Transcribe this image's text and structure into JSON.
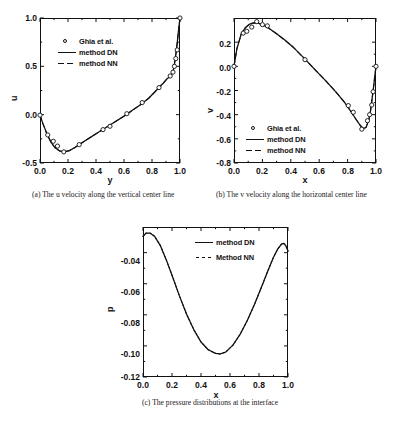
{
  "figure": {
    "background": "#ffffff",
    "ink": "#111111"
  },
  "panels": [
    {
      "id": "panel-a",
      "caption": "(a) The u velocity along the vertical center line",
      "legend": [
        {
          "marker": "circle",
          "label": "Ghia et al."
        },
        {
          "marker": "solid",
          "label": "method DN"
        },
        {
          "marker": "dash",
          "label": "method NN"
        }
      ],
      "chart_data": {
        "type": "line",
        "title": "",
        "xlabel": "y",
        "ylabel": "u",
        "xlim": [
          0.0,
          1.0
        ],
        "ylim": [
          -0.5,
          1.0
        ],
        "xticks": [
          "0.0",
          "0.2",
          "0.4",
          "0.6",
          "0.8",
          "1.0"
        ],
        "xtick_values": [
          0.0,
          0.2,
          0.4,
          0.6,
          0.8,
          1.0
        ],
        "yticks": [
          "1.0",
          "0.5",
          "0.0",
          "-0.5"
        ],
        "ytick_values": [
          1.0,
          0.5,
          0.0,
          -0.5
        ],
        "grid": false,
        "legend_position": "upper-left",
        "series": [
          {
            "name": "method DN",
            "style": "solid",
            "x": [
              0.0,
              0.02,
              0.05,
              0.08,
              0.11,
              0.14,
              0.17,
              0.21,
              0.25,
              0.3,
              0.36,
              0.42,
              0.48,
              0.54,
              0.6,
              0.66,
              0.72,
              0.78,
              0.84,
              0.88,
              0.91,
              0.93,
              0.95,
              0.96,
              0.97,
              0.98,
              0.99,
              1.0
            ],
            "y": [
              -0.005,
              -0.09,
              -0.2,
              -0.29,
              -0.345,
              -0.375,
              -0.385,
              -0.372,
              -0.34,
              -0.29,
              -0.235,
              -0.18,
              -0.125,
              -0.07,
              -0.015,
              0.045,
              0.105,
              0.175,
              0.265,
              0.325,
              0.375,
              0.395,
              0.44,
              0.52,
              0.62,
              0.74,
              0.88,
              1.0
            ]
          },
          {
            "name": "method NN",
            "style": "dashed",
            "x": [
              0.0,
              0.02,
              0.05,
              0.08,
              0.11,
              0.14,
              0.17,
              0.21,
              0.25,
              0.3,
              0.36,
              0.42,
              0.48,
              0.54,
              0.6,
              0.66,
              0.72,
              0.78,
              0.84,
              0.88,
              0.91,
              0.93,
              0.95,
              0.96,
              0.97,
              0.98,
              0.99,
              1.0
            ],
            "y": [
              -0.005,
              -0.09,
              -0.2,
              -0.29,
              -0.345,
              -0.375,
              -0.385,
              -0.372,
              -0.34,
              -0.29,
              -0.235,
              -0.18,
              -0.125,
              -0.07,
              -0.015,
              0.045,
              0.105,
              0.175,
              0.265,
              0.325,
              0.375,
              0.395,
              0.44,
              0.52,
              0.62,
              0.74,
              0.88,
              1.0
            ]
          },
          {
            "name": "Ghia et al.",
            "style": "markers",
            "x": [
              0.0,
              0.055,
              0.095,
              0.125,
              0.17,
              0.28,
              0.45,
              0.5,
              0.62,
              0.73,
              0.85,
              0.93,
              0.95,
              0.96,
              0.97,
              0.98,
              1.0
            ],
            "y": [
              -0.005,
              -0.21,
              -0.275,
              -0.325,
              -0.385,
              -0.31,
              -0.155,
              -0.12,
              0.01,
              0.125,
              0.28,
              0.4,
              0.44,
              0.5,
              0.58,
              0.67,
              1.0
            ]
          }
        ]
      }
    },
    {
      "id": "panel-b",
      "caption": "(b) The v velocity along the horizontal center line",
      "legend": [
        {
          "marker": "circle",
          "label": "Ghia et al."
        },
        {
          "marker": "solid",
          "label": "method DN"
        },
        {
          "marker": "dash",
          "label": "method NN"
        }
      ],
      "chart_data": {
        "type": "line",
        "title": "",
        "xlabel": "x",
        "ylabel": "v",
        "xlim": [
          0.0,
          1.0
        ],
        "ylim": [
          -0.8,
          0.4
        ],
        "xticks": [
          "0.0",
          "0.2",
          "0.4",
          "0.6",
          "0.8",
          "1.0"
        ],
        "xtick_values": [
          0.0,
          0.2,
          0.4,
          0.6,
          0.8,
          1.0
        ],
        "yticks": [
          "0.2",
          "0.0",
          "-0.2",
          "-0.4",
          "-0.6",
          "-0.8"
        ],
        "ytick_values": [
          0.2,
          0.0,
          -0.2,
          -0.4,
          -0.6,
          -0.8
        ],
        "grid": false,
        "legend_position": "lower-left",
        "series": [
          {
            "name": "method DN",
            "style": "solid",
            "x": [
              0.0,
              0.02,
              0.05,
              0.08,
              0.11,
              0.14,
              0.17,
              0.2,
              0.24,
              0.3,
              0.36,
              0.42,
              0.5,
              0.58,
              0.65,
              0.72,
              0.78,
              0.83,
              0.86,
              0.89,
              0.91,
              0.93,
              0.95,
              0.96,
              0.97,
              0.98,
              0.99,
              1.0
            ],
            "y": [
              0.0,
              0.145,
              0.265,
              0.32,
              0.35,
              0.36,
              0.358,
              0.345,
              0.32,
              0.27,
              0.215,
              0.155,
              0.06,
              -0.04,
              -0.125,
              -0.215,
              -0.3,
              -0.385,
              -0.44,
              -0.49,
              -0.515,
              -0.505,
              -0.44,
              -0.38,
              -0.29,
              -0.2,
              -0.1,
              0.0
            ]
          },
          {
            "name": "method NN",
            "style": "dashed",
            "x": [
              0.0,
              0.02,
              0.05,
              0.08,
              0.11,
              0.14,
              0.17,
              0.2,
              0.24,
              0.3,
              0.36,
              0.42,
              0.5,
              0.58,
              0.65,
              0.72,
              0.78,
              0.83,
              0.86,
              0.89,
              0.91,
              0.93,
              0.95,
              0.96,
              0.97,
              0.98,
              0.99,
              1.0
            ],
            "y": [
              0.0,
              0.145,
              0.265,
              0.32,
              0.35,
              0.36,
              0.358,
              0.345,
              0.32,
              0.27,
              0.215,
              0.155,
              0.06,
              -0.04,
              -0.125,
              -0.215,
              -0.3,
              -0.385,
              -0.44,
              -0.49,
              -0.515,
              -0.505,
              -0.44,
              -0.38,
              -0.29,
              -0.2,
              -0.1,
              0.0
            ]
          },
          {
            "name": "Ghia et al.",
            "style": "markers",
            "x": [
              0.0,
              0.065,
              0.09,
              0.125,
              0.16,
              0.2,
              0.235,
              0.5,
              0.805,
              0.84,
              0.9,
              0.94,
              0.955,
              0.97,
              0.98,
              1.0
            ],
            "y": [
              0.0,
              0.275,
              0.29,
              0.325,
              0.37,
              0.345,
              0.335,
              0.055,
              -0.325,
              -0.38,
              -0.52,
              -0.45,
              -0.4,
              -0.32,
              -0.21,
              0.0
            ]
          }
        ]
      }
    },
    {
      "id": "panel-c",
      "caption": "(c) The pressure distributions at the interface",
      "legend": [
        {
          "marker": "solid",
          "label": "method DN"
        },
        {
          "marker": "dot",
          "label": "Method NN"
        }
      ],
      "chart_data": {
        "type": "line",
        "title": "",
        "xlabel": "x",
        "ylabel": "p",
        "xlim": [
          0.0,
          1.0
        ],
        "ylim": [
          -0.12,
          -0.0235
        ],
        "xticks": [
          "0.0",
          "0.2",
          "0.4",
          "0.6",
          "0.8",
          "1.0"
        ],
        "xtick_values": [
          0.0,
          0.2,
          0.4,
          0.6,
          0.8,
          1.0
        ],
        "yticks": [
          "-0.04",
          "-0.06",
          "-0.08",
          "-0.10",
          "-0.12"
        ],
        "ytick_values": [
          -0.04,
          -0.06,
          -0.08,
          -0.1,
          -0.12
        ],
        "grid": false,
        "legend_position": "upper-right",
        "series": [
          {
            "name": "method DN",
            "style": "solid",
            "x": [
              0.0,
              0.02,
              0.05,
              0.08,
              0.12,
              0.16,
              0.2,
              0.25,
              0.3,
              0.35,
              0.4,
              0.45,
              0.5,
              0.53,
              0.57,
              0.62,
              0.67,
              0.72,
              0.77,
              0.82,
              0.86,
              0.9,
              0.93,
              0.955,
              0.97,
              0.985,
              1.0
            ],
            "y": [
              -0.0295,
              -0.0275,
              -0.0275,
              -0.0295,
              -0.0355,
              -0.0445,
              -0.0545,
              -0.0675,
              -0.0795,
              -0.0895,
              -0.0975,
              -0.1025,
              -0.1048,
              -0.1052,
              -0.104,
              -0.0995,
              -0.0925,
              -0.0835,
              -0.073,
              -0.0615,
              -0.052,
              -0.043,
              -0.0375,
              -0.0345,
              -0.034,
              -0.0355,
              -0.039
            ]
          },
          {
            "name": "Method NN",
            "style": "dotted",
            "x": [
              0.0,
              0.02,
              0.05,
              0.08,
              0.12,
              0.16,
              0.2,
              0.25,
              0.3,
              0.35,
              0.4,
              0.45,
              0.5,
              0.53,
              0.57,
              0.62,
              0.67,
              0.72,
              0.77,
              0.82,
              0.86,
              0.9,
              0.93,
              0.955,
              0.97,
              0.985,
              1.0
            ],
            "y": [
              -0.0295,
              -0.0275,
              -0.0275,
              -0.0295,
              -0.0355,
              -0.0445,
              -0.0545,
              -0.0675,
              -0.0795,
              -0.0895,
              -0.0975,
              -0.1025,
              -0.1048,
              -0.1052,
              -0.104,
              -0.0995,
              -0.0925,
              -0.0835,
              -0.073,
              -0.0615,
              -0.052,
              -0.043,
              -0.0375,
              -0.0345,
              -0.034,
              -0.0355,
              -0.039
            ]
          }
        ]
      }
    }
  ]
}
